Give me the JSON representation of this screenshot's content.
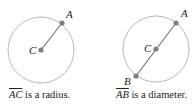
{
  "figures": [
    {
      "id": "radius",
      "circle": {
        "cx": 41,
        "cy": 50,
        "r": 33
      },
      "points": [
        {
          "name": "C",
          "x": 41,
          "y": 50,
          "label_x": 29,
          "label_y": 54
        },
        {
          "name": "A",
          "x": 62,
          "y": 23,
          "label_x": 66,
          "label_y": 18
        }
      ],
      "segment": [
        "C",
        "A"
      ],
      "caption": {
        "segment": "AC",
        "text": " is a radius."
      }
    },
    {
      "id": "diameter",
      "circle": {
        "cx": 156,
        "cy": 49,
        "r": 33
      },
      "points": [
        {
          "name": "C",
          "x": 156,
          "y": 49,
          "label_x": 144,
          "label_y": 52
        },
        {
          "name": "A",
          "x": 176,
          "y": 23,
          "label_x": 181,
          "label_y": 17
        },
        {
          "name": "B",
          "x": 136,
          "y": 76,
          "label_x": 124,
          "label_y": 85
        }
      ],
      "segment": [
        "A",
        "B"
      ],
      "caption": {
        "segment": "AB",
        "text": " is a diameter."
      }
    }
  ],
  "colors": {
    "circle": "#b8b8b8",
    "segment": "#6e6e6e",
    "point": "#808080",
    "text": "#222222"
  }
}
